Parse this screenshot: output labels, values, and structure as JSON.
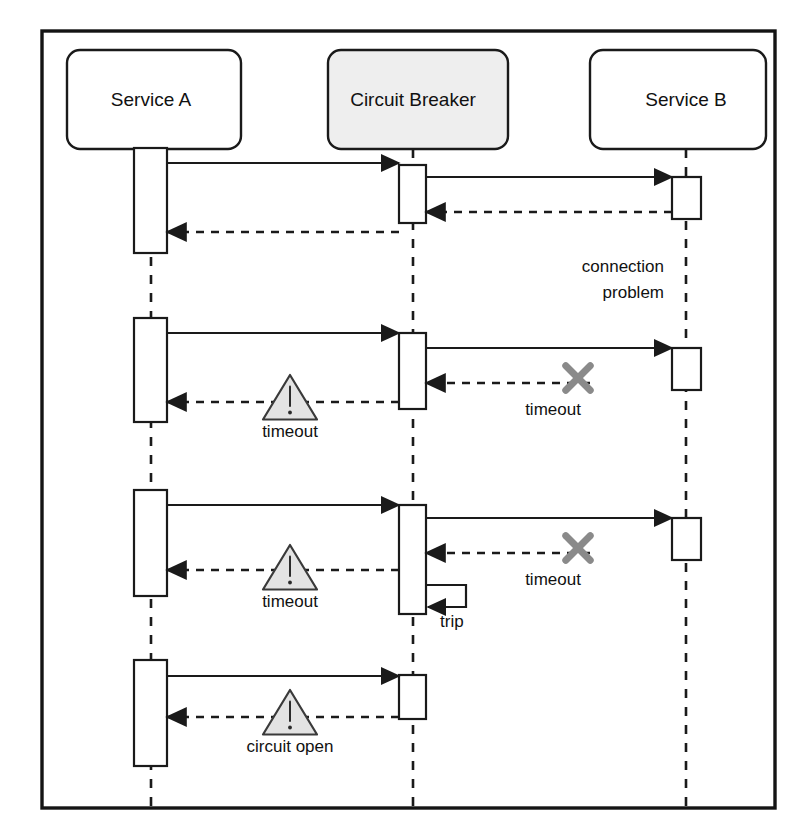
{
  "diagram": {
    "type": "uml-sequence-diagram",
    "frame": {
      "x": 42,
      "y": 31,
      "width": 733,
      "height": 777,
      "border_color": "#141414"
    }
  },
  "lifelines": [
    {
      "id": "service-a",
      "label": "Service A",
      "box": {
        "x": 67,
        "y": 50,
        "width": 174,
        "height": 99
      },
      "center_x": 151,
      "fill": "#ffffff",
      "gray": false
    },
    {
      "id": "circuit-breaker",
      "label": "Circuit Breaker",
      "box": {
        "x": 328,
        "y": 50,
        "width": 180,
        "height": 99
      },
      "center_x": 413,
      "fill": "#eeeeee",
      "gray": true
    },
    {
      "id": "service-b",
      "label": "Service B",
      "box": {
        "x": 590,
        "y": 50,
        "width": 176,
        "height": 99
      },
      "center_x": 686,
      "fill": "#ffffff",
      "gray": false
    }
  ],
  "lifeline_dashes": [
    {
      "x": 151,
      "y1": 149,
      "y2": 812
    },
    {
      "x": 413,
      "y1": 149,
      "y2": 812
    },
    {
      "x": 686,
      "y1": 149,
      "y2": 812
    }
  ],
  "activations": [
    {
      "owner": "service-a",
      "x": 134,
      "y": 148,
      "width": 33,
      "height": 105
    },
    {
      "owner": "service-a",
      "x": 134,
      "y": 318,
      "width": 33,
      "height": 104
    },
    {
      "owner": "service-a",
      "x": 134,
      "y": 490,
      "width": 33,
      "height": 106
    },
    {
      "owner": "service-a",
      "x": 134,
      "y": 660,
      "width": 33,
      "height": 106
    },
    {
      "owner": "circuit-breaker",
      "x": 399,
      "y": 165,
      "width": 27,
      "height": 58
    },
    {
      "owner": "circuit-breaker",
      "x": 399,
      "y": 333,
      "width": 27,
      "height": 76
    },
    {
      "owner": "circuit-breaker",
      "x": 399,
      "y": 505,
      "width": 27,
      "height": 109
    },
    {
      "owner": "circuit-breaker",
      "x": 399,
      "y": 675,
      "width": 27,
      "height": 44
    },
    {
      "owner": "service-b",
      "x": 672,
      "y": 177,
      "width": 29,
      "height": 42
    },
    {
      "owner": "service-b",
      "x": 672,
      "y": 348,
      "width": 29,
      "height": 42
    },
    {
      "owner": "service-b",
      "x": 672,
      "y": 518,
      "width": 29,
      "height": 42
    }
  ],
  "messages": [
    {
      "id": "m1-req-cb",
      "kind": "solid",
      "from_x": 167,
      "to_x": 399,
      "y": 163,
      "label": ""
    },
    {
      "id": "m1-req-b",
      "kind": "solid",
      "from_x": 426,
      "to_x": 672,
      "y": 177,
      "label": ""
    },
    {
      "id": "m1-ret-cb",
      "kind": "dashed",
      "from_x": 672,
      "to_x": 426,
      "y": 212,
      "label": ""
    },
    {
      "id": "m1-ret-a",
      "kind": "dashed",
      "from_x": 399,
      "to_x": 167,
      "y": 232,
      "label": ""
    },
    {
      "id": "m2-req-cb",
      "kind": "solid",
      "from_x": 167,
      "to_x": 399,
      "y": 333,
      "label": ""
    },
    {
      "id": "m2-req-b",
      "kind": "solid",
      "from_x": 426,
      "to_x": 672,
      "y": 348,
      "label": ""
    },
    {
      "id": "m2-ret-cb",
      "kind": "dashed",
      "from_x": 590,
      "to_x": 426,
      "y": 383,
      "label": "timeout"
    },
    {
      "id": "m2-ret-a",
      "kind": "dashed",
      "from_x": 399,
      "to_x": 167,
      "y": 402,
      "label": "timeout"
    },
    {
      "id": "m3-req-cb",
      "kind": "solid",
      "from_x": 167,
      "to_x": 399,
      "y": 505,
      "label": ""
    },
    {
      "id": "m3-req-b",
      "kind": "solid",
      "from_x": 426,
      "to_x": 672,
      "y": 518,
      "label": ""
    },
    {
      "id": "m3-ret-cb",
      "kind": "dashed",
      "from_x": 590,
      "to_x": 426,
      "y": 553,
      "label": "timeout"
    },
    {
      "id": "m3-ret-a",
      "kind": "dashed",
      "from_x": 399,
      "to_x": 167,
      "y": 570,
      "label": "timeout"
    },
    {
      "id": "m4-req-cb",
      "kind": "solid",
      "from_x": 167,
      "to_x": 399,
      "y": 676,
      "label": ""
    },
    {
      "id": "m4-ret-a",
      "kind": "dashed",
      "from_x": 399,
      "to_x": 167,
      "y": 717,
      "label": "circuit open"
    }
  ],
  "self_message": {
    "id": "trip",
    "label": "trip",
    "owner": "circuit-breaker",
    "start_x": 426,
    "start_y": 585,
    "extent_x": 466,
    "end_y": 607,
    "label_x": 440,
    "label_y": 627
  },
  "notes": [
    {
      "id": "connection-problem",
      "lines": [
        "connection",
        "problem"
      ],
      "x": 664,
      "y": 272,
      "line_height": 26
    }
  ],
  "warning_icons": [
    {
      "id": "warn-timeout-2",
      "cx": 290,
      "cy": 400,
      "size": 25,
      "label": "timeout",
      "label_x": 290,
      "label_y": 437
    },
    {
      "id": "warn-timeout-3",
      "cx": 290,
      "cy": 570,
      "size": 25,
      "label": "timeout",
      "label_x": 290,
      "label_y": 607
    },
    {
      "id": "warn-circuit-open",
      "cx": 290,
      "cy": 715,
      "size": 25,
      "label": "circuit open",
      "label_x": 290,
      "label_y": 752
    }
  ],
  "x_marks": [
    {
      "id": "xmark-timeout-2",
      "cx": 578,
      "cy": 378,
      "size": 17,
      "label": "timeout",
      "label_x": 553,
      "label_y": 415
    },
    {
      "id": "xmark-timeout-3",
      "cx": 578,
      "cy": 548,
      "size": 17,
      "label": "timeout",
      "label_x": 553,
      "label_y": 585
    }
  ],
  "colors": {
    "stroke": "#1a1a1a",
    "frame": "#141414",
    "circuit_breaker_fill": "#eeeeee",
    "warning_fill": "#e3e3e3",
    "xmark": "#8a8a8a",
    "background": "#ffffff"
  }
}
